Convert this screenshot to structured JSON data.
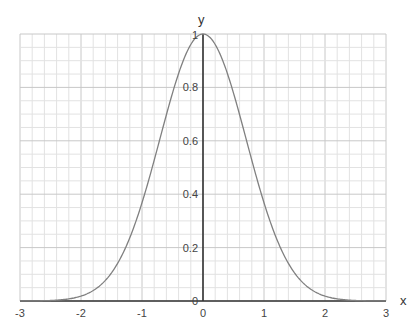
{
  "chart_data": {
    "type": "line",
    "title": "",
    "xlabel": "x",
    "ylabel": "y",
    "xlim": [
      -3,
      3
    ],
    "ylim": [
      0,
      1
    ],
    "grid": true,
    "legend": null,
    "x_ticks": [
      "-3",
      "-2",
      "-1",
      "0",
      "1",
      "2",
      "3"
    ],
    "y_ticks": [
      "0",
      "0.2",
      "0.4",
      "0.6",
      "0.8",
      "1"
    ],
    "function": "y = exp(-x^2)",
    "series": [
      {
        "name": "y = e^(-x^2)",
        "x": [
          -3,
          -2.5,
          -2,
          -1.75,
          -1.5,
          -1.25,
          -1,
          -0.75,
          -0.5,
          -0.25,
          0,
          0.25,
          0.5,
          0.75,
          1,
          1.25,
          1.5,
          1.75,
          2,
          2.5,
          3
        ],
        "values": [
          0.0001,
          0.0019,
          0.0183,
          0.0468,
          0.1054,
          0.2096,
          0.3679,
          0.5698,
          0.7788,
          0.9394,
          1.0,
          0.9394,
          0.7788,
          0.5698,
          0.3679,
          0.2096,
          0.1054,
          0.0468,
          0.0183,
          0.0019,
          0.0001
        ]
      }
    ]
  },
  "style": {
    "curve_color": "#808080",
    "axis_color": "#333333",
    "grid_minor_color": "#e2e2e2",
    "grid_major_color": "#c8c8c8"
  },
  "labels": {
    "x_axis": "x",
    "y_axis": "y"
  }
}
